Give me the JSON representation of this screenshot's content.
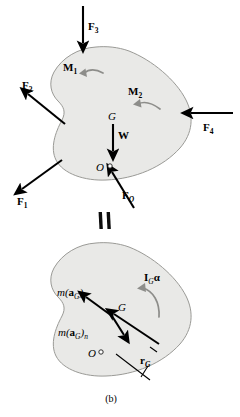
{
  "figure": {
    "caption": "(b)",
    "equals_symbol": "=",
    "colors": {
      "body_fill": "#e9e9e7",
      "body_stroke": "#9a9a96",
      "vector_color": "#000000",
      "moment_color": "#8d8d8a",
      "background": "#ffffff"
    }
  },
  "top_diagram": {
    "name": "free-body-diagram",
    "body_label": "rigid body",
    "forces": [
      {
        "id": "F3",
        "base": "F",
        "sub": "3",
        "direction": "down",
        "description": "downward force at top of body"
      },
      {
        "id": "F2",
        "base": "F",
        "sub": "2",
        "direction": "up-left",
        "description": "force directed up and left from left side"
      },
      {
        "id": "F1",
        "base": "F",
        "sub": "1",
        "direction": "down-left",
        "description": "force directed down and left from lower left"
      },
      {
        "id": "F4",
        "base": "F",
        "sub": "4",
        "direction": "left",
        "description": "force directed left into right side"
      },
      {
        "id": "FO",
        "base": "F",
        "sub": "O",
        "direction": "up-left",
        "description": "force applied at point O"
      },
      {
        "id": "W",
        "base": "W",
        "sub": "",
        "direction": "down",
        "description": "weight acting at mass center G"
      }
    ],
    "moments": [
      {
        "id": "M1",
        "base": "M",
        "sub": "1",
        "sense": "counterclockwise-arc-pointing-left"
      },
      {
        "id": "M2",
        "base": "M",
        "sub": "2",
        "sense": "counterclockwise-arc-pointing-left"
      }
    ],
    "points": [
      {
        "id": "G",
        "label": "G",
        "description": "mass center"
      },
      {
        "id": "O",
        "label": "O",
        "description": "arbitrary reference point, marked with small circle"
      }
    ]
  },
  "bottom_diagram": {
    "name": "kinetic-diagram",
    "vectors": [
      {
        "id": "maGt",
        "prefix": "m(",
        "bold": "a",
        "sub1": "G",
        "close": ")",
        "sub2": "t",
        "description": "tangential effective force at G, up-left"
      },
      {
        "id": "maGn",
        "prefix": "m(",
        "bold": "a",
        "sub1": "G",
        "close": ")",
        "sub2": "n",
        "description": "normal effective force at G, down-right"
      },
      {
        "id": "rG",
        "prefix": "",
        "bold": "r",
        "sub1": "G",
        "close": "",
        "sub2": "",
        "description": "position vector from O to G"
      }
    ],
    "moments": [
      {
        "id": "IGalpha",
        "bold": "I",
        "sub": "G",
        "greek": "α",
        "sense": "counterclockwise-arc-pointing-left"
      }
    ],
    "points": [
      {
        "id": "G",
        "label": "G",
        "description": "mass center"
      },
      {
        "id": "O",
        "label": "O",
        "description": "arbitrary reference point, marked with small circle"
      }
    ]
  }
}
